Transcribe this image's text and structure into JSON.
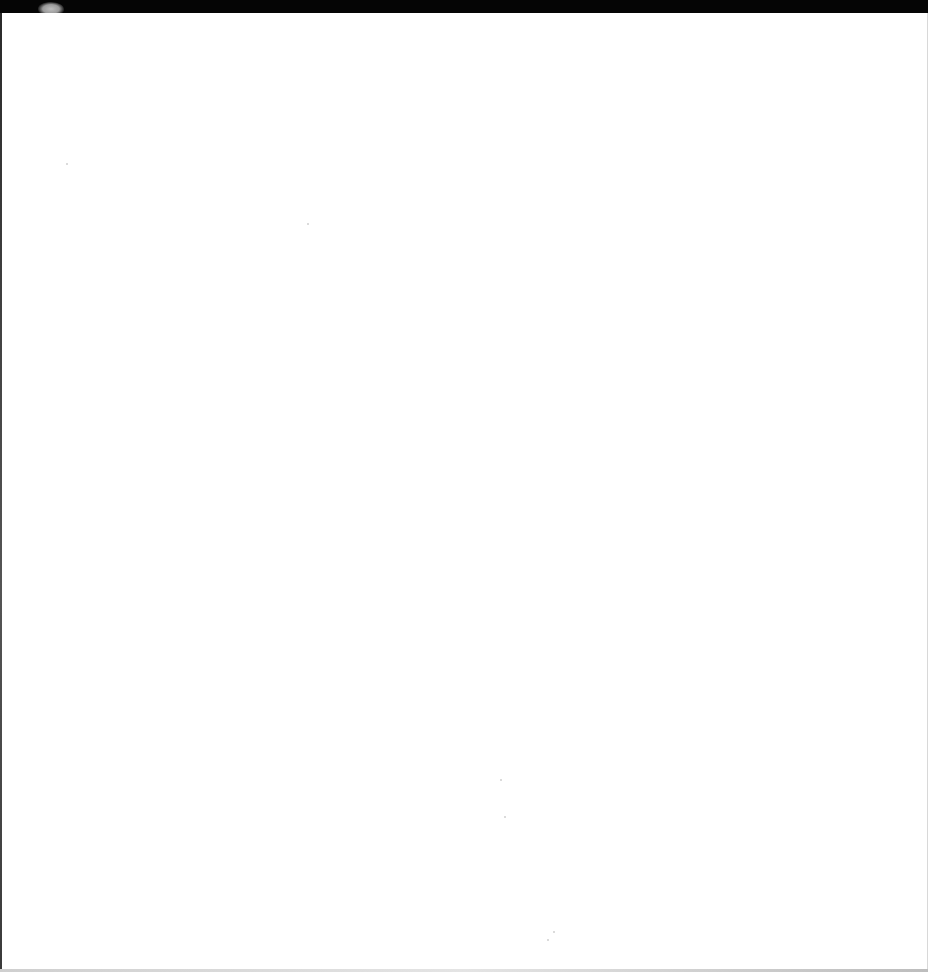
{
  "document": {
    "type": "scanned-page",
    "content": "",
    "is_blank": true
  }
}
